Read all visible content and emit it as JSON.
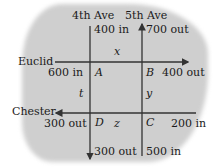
{
  "streets": {
    "avenue_1": "4th Ave",
    "avenue_2": "5th Ave",
    "street_1": "Euclid",
    "street_2": "Chester"
  },
  "intersections": {
    "A": "A",
    "B": "B",
    "C": "C",
    "D": "D"
  },
  "unknowns": {
    "x": "x",
    "y": "y",
    "z": "z",
    "t": "t"
  },
  "flows": {
    "fourth_top": "400 in",
    "fifth_top": "700 out",
    "euclid_left": "600 in",
    "euclid_right": "400 out",
    "chester_left": "300 out",
    "chester_right": "200 in",
    "fourth_bottom": "300 out",
    "fifth_bottom": "500 in"
  },
  "colors": {
    "background_blob": "#cfcfcf",
    "lines": "#333333"
  }
}
